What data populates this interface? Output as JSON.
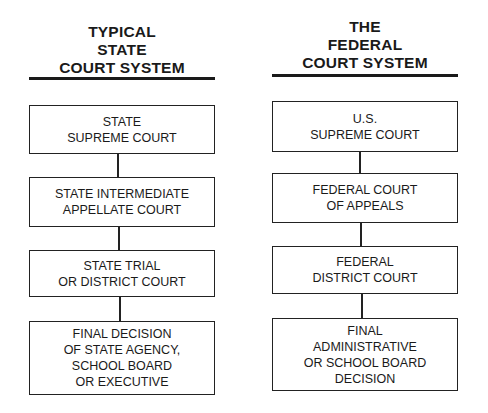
{
  "diagram": {
    "type": "hierarchy",
    "columns": [
      {
        "id": "state",
        "title_lines": [
          "TYPICAL",
          "STATE",
          "COURT SYSTEM"
        ],
        "levels": [
          {
            "lines": [
              "STATE",
              "SUPREME COURT"
            ]
          },
          {
            "lines": [
              "STATE INTERMEDIATE",
              "APPELLATE COURT"
            ]
          },
          {
            "lines": [
              "STATE TRIAL",
              "OR DISTRICT COURT"
            ]
          },
          {
            "lines": [
              "FINAL DECISION",
              "OF STATE AGENCY,",
              "SCHOOL BOARD",
              "OR EXECUTIVE"
            ]
          }
        ]
      },
      {
        "id": "federal",
        "title_lines": [
          "THE",
          "FEDERAL",
          "COURT SYSTEM"
        ],
        "levels": [
          {
            "lines": [
              "U.S.",
              "SUPREME COURT"
            ]
          },
          {
            "lines": [
              "FEDERAL COURT",
              "OF APPEALS"
            ]
          },
          {
            "lines": [
              "FEDERAL",
              "DISTRICT COURT"
            ]
          },
          {
            "lines": [
              "FINAL",
              "ADMINISTRATIVE",
              "OR SCHOOL BOARD",
              "DECISION"
            ]
          }
        ]
      }
    ],
    "edges": [
      {
        "from": "state.0",
        "to": "state.1"
      },
      {
        "from": "state.1",
        "to": "state.2"
      },
      {
        "from": "state.2",
        "to": "state.3"
      },
      {
        "from": "federal.0",
        "to": "federal.1"
      },
      {
        "from": "federal.1",
        "to": "federal.2"
      },
      {
        "from": "federal.2",
        "to": "federal.3"
      }
    ]
  }
}
